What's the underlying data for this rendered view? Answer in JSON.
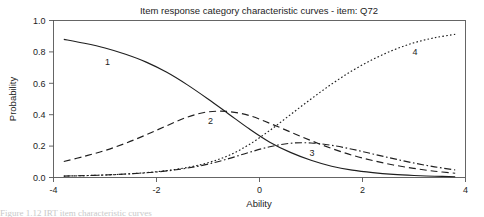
{
  "figure": {
    "background_color": "#ffffff",
    "line_color": "#1f1f1f",
    "frame_color": "#555555",
    "caption_fragment": "Figure 1.12   IRT item characteristic curves"
  },
  "chart_data": {
    "type": "line",
    "title": "Item response category characteristic curves - item: Q72",
    "xlabel": "Ability",
    "ylabel": "Probability",
    "xlim": [
      -4,
      4
    ],
    "ylim": [
      0,
      1
    ],
    "xticks": [
      -4,
      -2,
      0,
      2,
      4
    ],
    "xtick_labels": [
      "-4",
      "-2",
      "0",
      "2",
      "4"
    ],
    "yticks": [
      0.0,
      0.2,
      0.4,
      0.6,
      0.8,
      1.0
    ],
    "ytick_labels": [
      "0.0",
      "0.2",
      "0.4",
      "0.6",
      "0.8",
      "1.0"
    ],
    "grid": false,
    "legend": "inline-curve-labels",
    "x": [
      -3.8,
      -3.4,
      -3.0,
      -2.6,
      -2.2,
      -1.8,
      -1.4,
      -1.0,
      -0.6,
      -0.2,
      0.2,
      0.6,
      1.0,
      1.4,
      1.8,
      2.2,
      2.6,
      3.0,
      3.4,
      3.8
    ],
    "series": [
      {
        "name": "1",
        "label": "1",
        "linestyle": "solid",
        "label_x": -2.95,
        "label_y": 0.735,
        "values": [
          0.88,
          0.855,
          0.825,
          0.785,
          0.735,
          0.67,
          0.59,
          0.5,
          0.405,
          0.31,
          0.225,
          0.16,
          0.11,
          0.072,
          0.047,
          0.031,
          0.02,
          0.013,
          0.008,
          0.005
        ]
      },
      {
        "name": "2",
        "label": "2",
        "linestyle": "dashed",
        "label_x": -0.95,
        "label_y": 0.36,
        "values": [
          0.102,
          0.135,
          0.172,
          0.218,
          0.272,
          0.33,
          0.385,
          0.418,
          0.42,
          0.395,
          0.345,
          0.29,
          0.235,
          0.185,
          0.142,
          0.108,
          0.08,
          0.058,
          0.04,
          0.027
        ]
      },
      {
        "name": "3",
        "label": "3",
        "linestyle": "dashdot",
        "label_x": 1.02,
        "label_y": 0.158,
        "values": [
          0.009,
          0.012,
          0.016,
          0.022,
          0.03,
          0.042,
          0.06,
          0.085,
          0.12,
          0.16,
          0.196,
          0.218,
          0.22,
          0.205,
          0.18,
          0.15,
          0.12,
          0.092,
          0.068,
          0.048
        ]
      },
      {
        "name": "4",
        "label": "4",
        "linestyle": "dotted",
        "label_x": 3.02,
        "label_y": 0.8,
        "values": [
          0.009,
          0.012,
          0.016,
          0.022,
          0.031,
          0.044,
          0.064,
          0.094,
          0.14,
          0.21,
          0.3,
          0.4,
          0.5,
          0.595,
          0.68,
          0.752,
          0.812,
          0.858,
          0.89,
          0.912
        ]
      }
    ]
  }
}
